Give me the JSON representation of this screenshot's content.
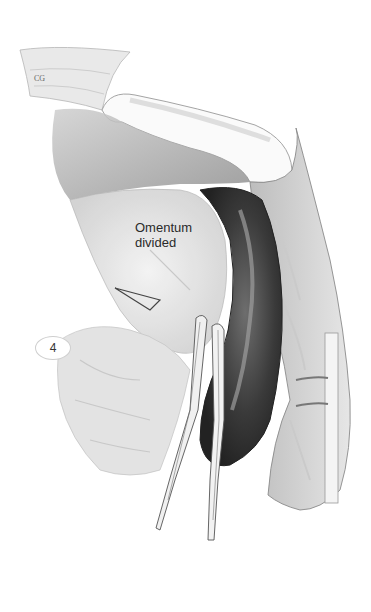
{
  "figure": {
    "annotation_label": "Omentum\ndivided",
    "annotation_lines": [
      "Omentum",
      "divided"
    ],
    "step_number": "4",
    "signature": "CG"
  }
}
